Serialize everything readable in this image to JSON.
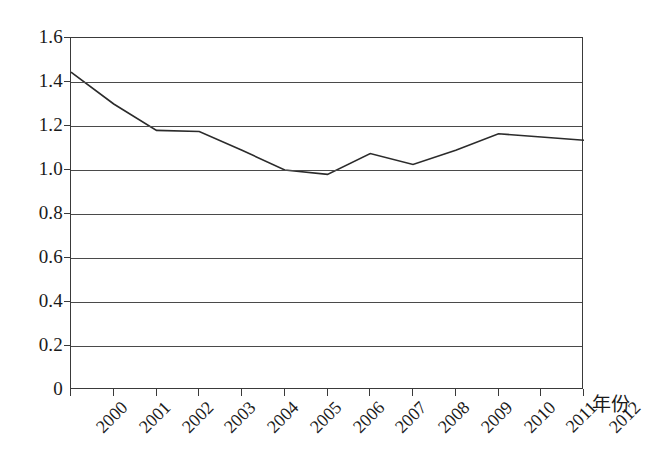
{
  "chart_data": {
    "type": "line",
    "title": "",
    "subtitle": "",
    "xlabel": "年份",
    "ylabel": "",
    "categories": [
      "2000",
      "2001",
      "2002",
      "2003",
      "2004",
      "2005",
      "2006",
      "2007",
      "2008",
      "2009",
      "2010",
      "2011",
      "2012"
    ],
    "x": [
      2000,
      2001,
      2002,
      2003,
      2004,
      2005,
      2006,
      2007,
      2008,
      2009,
      2010,
      2011,
      2012
    ],
    "series": [
      {
        "name": "",
        "values": [
          1.445,
          1.3,
          1.18,
          1.175,
          1.09,
          1.0,
          0.98,
          1.075,
          1.025,
          1.09,
          1.165,
          1.15,
          1.135
        ]
      }
    ],
    "values": [
      1.445,
      1.3,
      1.18,
      1.175,
      1.09,
      1.0,
      0.98,
      1.075,
      1.025,
      1.09,
      1.165,
      1.15,
      1.135
    ],
    "ylim": [
      0,
      1.6
    ],
    "yticks": [
      0,
      0.2,
      0.4,
      0.6,
      0.8,
      1.0,
      1.2,
      1.4,
      1.6
    ],
    "ytick_labels": [
      "0",
      "0.2",
      "0.4",
      "0.6",
      "0.8",
      "1.0",
      "1.2",
      "1.4",
      "1.6"
    ],
    "xlim": [
      2000,
      2012
    ],
    "grid": "horizontal",
    "legend": "none",
    "markers": "none",
    "annotations": [],
    "colors": {
      "line": "#2b2b2b",
      "grid": "#4a4a4a",
      "axis": "#3a3a3a",
      "background": "#ffffff",
      "text": "#1a1a1a"
    },
    "line_width": 1.6
  }
}
